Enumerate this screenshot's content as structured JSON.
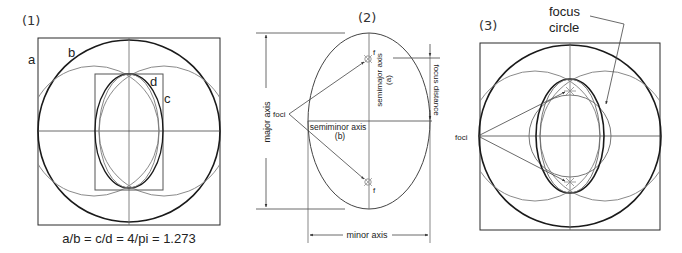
{
  "panels": [
    {
      "id": "panel-1",
      "number": "(1)",
      "labels": {
        "a": "a",
        "b": "b",
        "c": "c",
        "d": "d"
      },
      "caption": "a/b = c/d = 4/pi = 1.273"
    },
    {
      "id": "panel-2",
      "number": "(2)",
      "labels": {
        "major_axis": "major axis",
        "minor_axis": "minor axis",
        "semimajor_axis": "semimajor axis",
        "semimajor_symbol": "(a)",
        "semiminor_axis": "semiminor axis",
        "semiminor_symbol": "(b)",
        "focus_distance": "focus distance",
        "foci": "foci",
        "focus_top": "f",
        "focus_bottom": "f"
      }
    },
    {
      "id": "panel-3",
      "number": "(3)",
      "labels": {
        "focus_circle_line1": "focus",
        "focus_circle_line2": "circle",
        "foci": "foci"
      }
    }
  ],
  "colors": {
    "line_dark": "#1a1a1a",
    "line_mid": "#555555",
    "line_light": "#8a8a8a",
    "text": "#222222"
  }
}
